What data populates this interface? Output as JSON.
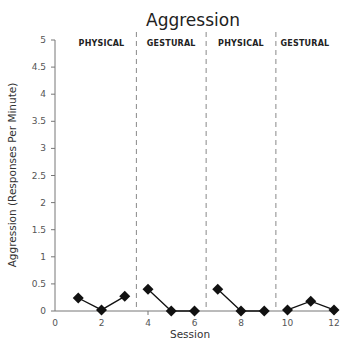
{
  "chart_data": {
    "type": "line",
    "title": "Aggression",
    "xlabel": "Session",
    "ylabel": "Aggression (Responses Per Minute)",
    "xlim": [
      0,
      12
    ],
    "ylim": [
      0,
      5
    ],
    "xticks": [
      0,
      2,
      4,
      6,
      8,
      10,
      12
    ],
    "xtick_labels": [
      "0",
      "2",
      "4",
      "6",
      "8",
      "10",
      "12"
    ],
    "yticks": [
      0,
      0.5,
      1,
      1.5,
      2,
      2.5,
      3,
      3.5,
      4,
      4.5,
      5
    ],
    "ytick_labels": [
      "0",
      "0.5",
      "1",
      "1.5",
      "2",
      "2.5",
      "3",
      "3.5",
      "4",
      "4.5",
      "5"
    ],
    "grid": false,
    "phase_dividers": [
      3.5,
      6.5,
      9.5
    ],
    "phases": [
      {
        "label": "PHYSICAL",
        "sessions": [
          1,
          2,
          3
        ],
        "values": [
          0.24,
          0.02,
          0.27
        ]
      },
      {
        "label": "GESTURAL",
        "sessions": [
          4,
          5,
          6
        ],
        "values": [
          0.4,
          0.0,
          0.0
        ]
      },
      {
        "label": "PHYSICAL",
        "sessions": [
          7,
          8,
          9
        ],
        "values": [
          0.4,
          0.0,
          0.0
        ]
      },
      {
        "label": "GESTURAL",
        "sessions": [
          10,
          11,
          12
        ],
        "values": [
          0.02,
          0.18,
          0.02
        ]
      }
    ],
    "series": [
      {
        "name": "Aggression",
        "marker": "diamond",
        "color": "#111111",
        "x": [
          1,
          2,
          3,
          4,
          5,
          6,
          7,
          8,
          9,
          10,
          11,
          12
        ],
        "values": [
          0.24,
          0.02,
          0.27,
          0.4,
          0.0,
          0.0,
          0.4,
          0.0,
          0.0,
          0.02,
          0.18,
          0.02
        ]
      }
    ]
  }
}
